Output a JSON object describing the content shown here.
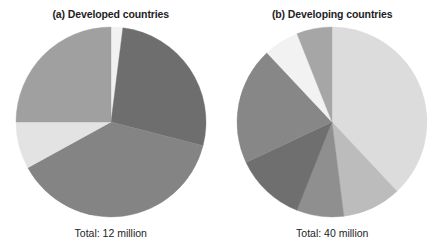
{
  "figure": {
    "background": "#ffffff",
    "panels": [
      {
        "id": "panel-a",
        "title": "(a) Developed countries",
        "total_label": "Total: 12 million",
        "ghost_text": ""
      },
      {
        "id": "panel-b",
        "title": "(b) Developing countries",
        "total_label": "Total: 40 million",
        "ghost_text": ""
      }
    ]
  },
  "chart_data": [
    {
      "type": "pie",
      "title": "(a) Developed countries",
      "subtitle": "Total: 12 million",
      "total": 12,
      "total_units": "million",
      "start_angle_deg": 0,
      "direction": "clockwise",
      "legend": "none",
      "grid": false,
      "center": {
        "cx": 115,
        "cy": 127,
        "r": 95
      },
      "categories": [
        "Slice 1",
        "Slice 2",
        "Slice 3",
        "Slice 4",
        "Slice 5"
      ],
      "values": [
        2,
        27,
        38,
        8,
        25
      ],
      "colors": [
        "#f1f1f1",
        "#6e6e6e",
        "#848484",
        "#e3e3e3",
        "#a0a0a0"
      ],
      "slices": [
        {
          "label": "Slice 1",
          "value": 2,
          "color": "#f1f1f1"
        },
        {
          "label": "Slice 2",
          "value": 27,
          "color": "#6e6e6e"
        },
        {
          "label": "Slice 3",
          "value": 38,
          "color": "#848484"
        },
        {
          "label": "Slice 4",
          "value": 8,
          "color": "#e3e3e3"
        },
        {
          "label": "Slice 5",
          "value": 25,
          "color": "#a0a0a0"
        }
      ]
    },
    {
      "type": "pie",
      "title": "(b) Developing countries",
      "subtitle": "Total: 40 million",
      "total": 40,
      "total_units": "million",
      "start_angle_deg": 0,
      "direction": "clockwise",
      "legend": "none",
      "grid": false,
      "center": {
        "cx": 335,
        "cy": 128,
        "r": 95
      },
      "categories": [
        "Slice 1",
        "Slice 2",
        "Slice 3",
        "Slice 4",
        "Slice 5",
        "Slice 6",
        "Slice 7"
      ],
      "values": [
        38,
        10,
        8,
        12,
        20,
        6,
        6
      ],
      "colors": [
        "#dcdcdc",
        "#bcbcbc",
        "#8f8f8f",
        "#6f6f6f",
        "#878787",
        "#f2f2f2",
        "#a6a6a6"
      ],
      "slices": [
        {
          "label": "Slice 1",
          "value": 38,
          "color": "#dcdcdc"
        },
        {
          "label": "Slice 2",
          "value": 10,
          "color": "#bcbcbc"
        },
        {
          "label": "Slice 3",
          "value": 8,
          "color": "#8f8f8f"
        },
        {
          "label": "Slice 4",
          "value": 12,
          "color": "#6f6f6f"
        },
        {
          "label": "Slice 5",
          "value": 20,
          "color": "#878787"
        },
        {
          "label": "Slice 6",
          "value": 6,
          "color": "#f2f2f2"
        },
        {
          "label": "Slice 7",
          "value": 6,
          "color": "#a6a6a6"
        }
      ]
    }
  ]
}
